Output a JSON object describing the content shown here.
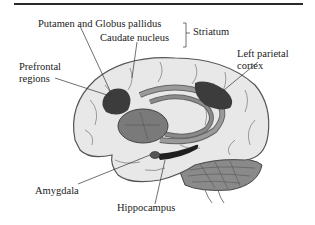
{
  "labels": {
    "putamen_globus": "Putamen and Globus pallidus",
    "caudate": "Caudate nucleus",
    "striatum": "Striatum",
    "prefrontal_1": "Prefrontal",
    "prefrontal_2": "regions",
    "parietal_1": "Left parietal",
    "parietal_2": "cortex",
    "amygdala": "Amygdala",
    "hippocampus": "Hippocampus"
  },
  "colors": {
    "brain_fill": "#e8e8e8",
    "brain_outline": "#555555",
    "dark_region": "#3c3c3c",
    "mid_region": "#7a7a7a",
    "light_region": "#9a9a9a"
  }
}
